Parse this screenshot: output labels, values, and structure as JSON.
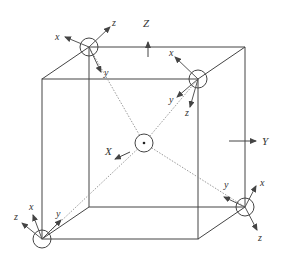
{
  "diagram": {
    "colors": {
      "line": "#444444",
      "dotted": "#9a9a9a",
      "arrow": "#555555"
    },
    "global_axes": {
      "z_label": "Z",
      "y_label": "Y",
      "x_label": "X"
    },
    "frames": [
      {
        "id": "top-back-left",
        "labels": [
          "x",
          "z",
          "y"
        ]
      },
      {
        "id": "front-top-right",
        "labels": [
          "x",
          "y",
          "z"
        ]
      },
      {
        "id": "back-bottom-right",
        "labels": [
          "y",
          "x",
          "z"
        ]
      },
      {
        "id": "front-bottom-left",
        "labels": [
          "z",
          "x",
          "y"
        ]
      }
    ]
  }
}
